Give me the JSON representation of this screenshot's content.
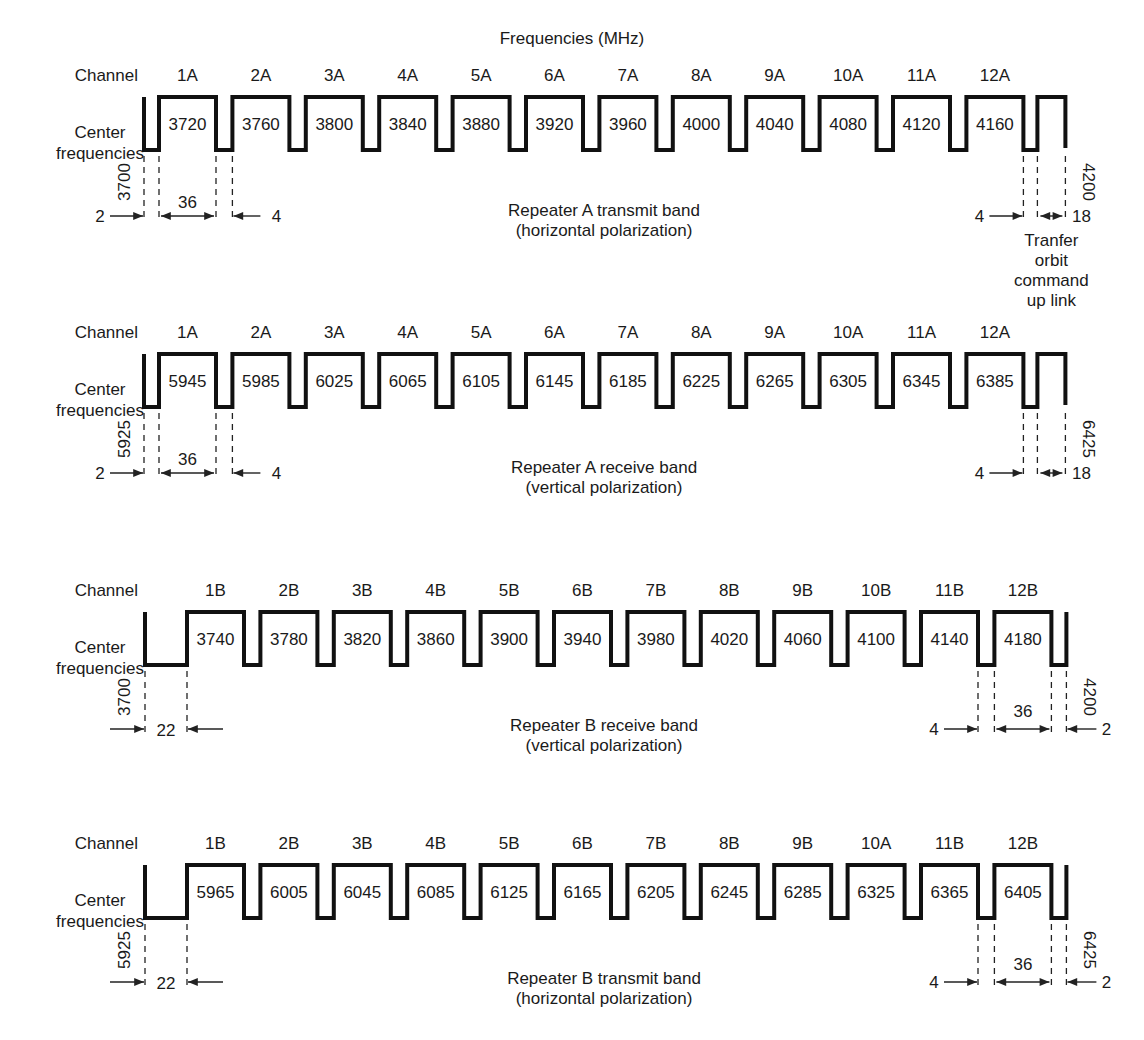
{
  "title": "Frequencies (MHz)",
  "row_labels": {
    "channel": "Channel",
    "center_line1": "Center",
    "center_line2": "frequencies"
  },
  "bands": [
    {
      "id": "repeater-a-transmit",
      "type": "A",
      "caption_line1": "Repeater A transmit band",
      "caption_line2": "(horizontal polarization)",
      "start_freq": "3700",
      "end_freq": "4200",
      "channels": [
        "1A",
        "2A",
        "3A",
        "4A",
        "5A",
        "6A",
        "7A",
        "8A",
        "9A",
        "10A",
        "11A",
        "12A"
      ],
      "center_frequencies": [
        "3720",
        "3760",
        "3800",
        "3840",
        "3880",
        "3920",
        "3960",
        "4000",
        "4040",
        "4080",
        "4120",
        "4160"
      ],
      "dims": {
        "left_guard": "2",
        "bandwidth": "36",
        "gap": "4",
        "right_gap": "4",
        "command": "18"
      },
      "command_note": [
        "Tranfer",
        "orbit",
        "command",
        "up link"
      ]
    },
    {
      "id": "repeater-a-receive",
      "type": "A",
      "caption_line1": "Repeater A receive band",
      "caption_line2": "(vertical polarization)",
      "start_freq": "5925",
      "end_freq": "6425",
      "channels": [
        "1A",
        "2A",
        "3A",
        "4A",
        "5A",
        "6A",
        "7A",
        "8A",
        "9A",
        "10A",
        "11A",
        "12A"
      ],
      "center_frequencies": [
        "5945",
        "5985",
        "6025",
        "6065",
        "6105",
        "6145",
        "6185",
        "6225",
        "6265",
        "6305",
        "6345",
        "6385"
      ],
      "dims": {
        "left_guard": "2",
        "bandwidth": "36",
        "gap": "4",
        "right_gap": "4",
        "command": "18"
      }
    },
    {
      "id": "repeater-b-receive",
      "type": "B",
      "caption_line1": "Repeater B receive band",
      "caption_line2": "(vertical polarization)",
      "start_freq": "3700",
      "end_freq": "4200",
      "channels": [
        "1B",
        "2B",
        "3B",
        "4B",
        "5B",
        "6B",
        "7B",
        "8B",
        "9B",
        "10B",
        "11B",
        "12B"
      ],
      "center_frequencies": [
        "3740",
        "3780",
        "3820",
        "3860",
        "3900",
        "3940",
        "3980",
        "4020",
        "4060",
        "4100",
        "4140",
        "4180"
      ],
      "dims": {
        "left_guard": "22",
        "gap": "4",
        "bandwidth": "36",
        "right_guard": "2"
      }
    },
    {
      "id": "repeater-b-transmit",
      "type": "B",
      "caption_line1": "Repeater B transmit band",
      "caption_line2": "(horizontal polarization)",
      "start_freq": "5925",
      "end_freq": "6425",
      "channels": [
        "1B",
        "2B",
        "3B",
        "4B",
        "5B",
        "6B",
        "7B",
        "8B",
        "9B",
        "10A",
        "11B",
        "12B"
      ],
      "center_frequencies": [
        "5965",
        "6005",
        "6045",
        "6085",
        "6125",
        "6165",
        "6205",
        "6245",
        "6285",
        "6325",
        "6365",
        "6405"
      ],
      "dims": {
        "left_guard": "22",
        "gap": "4",
        "bandwidth": "36",
        "right_guard": "2"
      }
    }
  ]
}
